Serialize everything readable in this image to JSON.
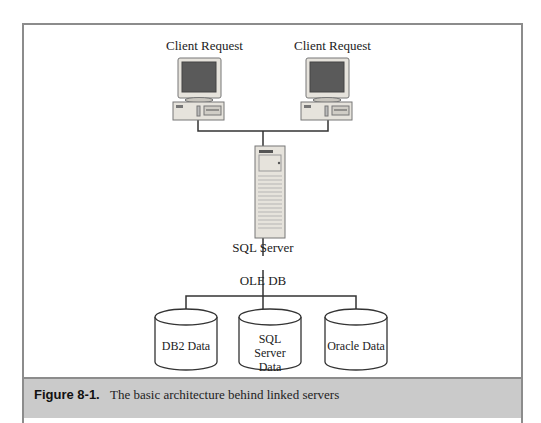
{
  "diagram": {
    "clients": [
      {
        "label": "Client Request"
      },
      {
        "label": "Client Request"
      }
    ],
    "server": {
      "label": "SQL Server"
    },
    "connector": {
      "label": "OLE DB"
    },
    "databases": [
      {
        "label": "DB2 Data"
      },
      {
        "label": "SQL Server Data"
      },
      {
        "label": "Oracle Data"
      }
    ]
  },
  "caption": {
    "number": "Figure 8-1.",
    "text": "The basic architecture behind linked servers"
  }
}
